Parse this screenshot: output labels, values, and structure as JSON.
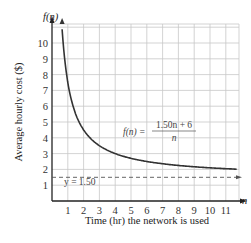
{
  "chart_data": {
    "type": "line",
    "title": "",
    "xlabel": "Time (hr) the network is used",
    "ylabel": "Average hourly cost ($)",
    "x_axis_symbol": "n",
    "y_axis_symbol": "f(n)",
    "xlim": [
      0,
      11.8
    ],
    "ylim": [
      0,
      11
    ],
    "x_ticks": [
      "1",
      "2",
      "3",
      "4",
      "5",
      "6",
      "7",
      "8",
      "9",
      "10",
      "11"
    ],
    "y_ticks": [
      "1",
      "2",
      "3",
      "4",
      "5",
      "6",
      "7",
      "8",
      "9",
      "10"
    ],
    "grid": true,
    "series": [
      {
        "name": "f(n) = (1.50n + 6)/n",
        "style": "solid",
        "x": [
          0.6,
          0.75,
          1,
          1.5,
          2,
          3,
          4,
          5,
          6,
          7,
          8,
          9,
          10,
          11,
          11.6
        ],
        "values": [
          11.5,
          9.5,
          7.5,
          5.5,
          4.5,
          3.5,
          3.0,
          2.7,
          2.5,
          2.36,
          2.25,
          2.17,
          2.1,
          2.05,
          2.02
        ]
      },
      {
        "name": "y = 1.50",
        "style": "dashed",
        "x": [
          0,
          11.8
        ],
        "values": [
          1.5,
          1.5
        ]
      }
    ],
    "annotations": [
      {
        "text": "f(n) = (1.50n + 6) / n",
        "x": 5.7,
        "y": 4.3
      },
      {
        "text": "y = 1.50",
        "x": 0.7,
        "y": 1.2
      }
    ]
  },
  "labels": {
    "y_symbol": "f(n)",
    "x_symbol": "n",
    "xlabel": "Time (hr) the network is used",
    "ylabel": "Average hourly cost ($)",
    "eq_lhs": "f(n) =",
    "eq_num": "1.50n + 6",
    "eq_den": "n",
    "asymptote": "y = 1.50"
  }
}
